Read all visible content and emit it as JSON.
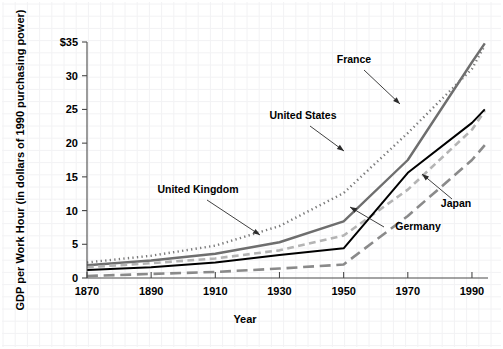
{
  "chart_data": {
    "type": "line",
    "title": "",
    "subtitle": "",
    "xlabel": "Year",
    "ylabel": "GDP per Work Hour (in dollars of 1990 purchasing power)",
    "xlim": [
      1870,
      1995
    ],
    "ylim": [
      0,
      35
    ],
    "grid": true,
    "grid_style": "faint graph-paper background grid",
    "legend": "inline labels with leader lines",
    "legend_position": "inline-annotations",
    "xticks": [
      1870,
      1890,
      1910,
      1930,
      1950,
      1970,
      1990
    ],
    "xtick_labels": [
      "1870",
      "1890",
      "1910",
      "1930",
      "1950",
      "1970",
      "1990"
    ],
    "yticks": [
      0,
      5,
      10,
      15,
      20,
      25,
      30,
      35
    ],
    "ytick_labels": [
      "0",
      "5",
      "10",
      "15",
      "20",
      "25",
      "30",
      "$35"
    ],
    "x": [
      1870,
      1890,
      1910,
      1930,
      1950,
      1970,
      1990,
      1994
    ],
    "series": [
      {
        "name": "France",
        "style": "solid",
        "color": "#6e6e6e",
        "width": 2.4,
        "values": [
          1.9,
          2.6,
          3.6,
          5.3,
          8.4,
          17.5,
          32.0,
          34.8
        ]
      },
      {
        "name": "United States",
        "style": "dotted",
        "color": "#7a7a7a",
        "width": 2.4,
        "values": [
          2.3,
          3.3,
          4.8,
          7.7,
          12.6,
          21.5,
          31.0,
          34.5
        ]
      },
      {
        "name": "United Kingdom",
        "style": "dashed",
        "color": "#b4b4b4",
        "width": 2.6,
        "values": [
          1.6,
          2.2,
          2.9,
          4.1,
          6.3,
          13.1,
          22.0,
          24.8
        ]
      },
      {
        "name": "Germany",
        "style": "solid",
        "color": "#000000",
        "width": 2.0,
        "values": [
          1.2,
          1.6,
          2.3,
          3.4,
          4.4,
          15.6,
          23.0,
          25.0
        ]
      },
      {
        "name": "Japan",
        "style": "long-dash",
        "color": "#8a8a8a",
        "width": 2.6,
        "values": [
          0.3,
          0.6,
          0.9,
          1.4,
          2.0,
          9.2,
          17.5,
          19.7
        ]
      }
    ],
    "annotations": [
      {
        "label": "France",
        "text_x": 354,
        "text_y": 63,
        "anchor": "middle",
        "leader_from_x": 364,
        "leader_from_y": 70,
        "leader_to_x": 400,
        "leader_to_y": 104
      },
      {
        "label": "United States",
        "text_x": 303,
        "text_y": 119,
        "anchor": "middle",
        "leader_from_x": 310,
        "leader_from_y": 126,
        "leader_to_x": 344,
        "leader_to_y": 151
      },
      {
        "label": "United Kingdom",
        "text_x": 198,
        "text_y": 193,
        "anchor": "middle",
        "leader_from_x": 207,
        "leader_from_y": 200,
        "leader_to_x": 260,
        "leader_to_y": 235
      },
      {
        "label": "Germany",
        "text_x": 418,
        "text_y": 230,
        "anchor": "middle",
        "leader_from_x": 384,
        "leader_from_y": 227,
        "leader_to_x": 350,
        "leader_to_y": 207
      },
      {
        "label": "Japan",
        "text_x": 456,
        "text_y": 207,
        "anchor": "middle",
        "leader_from_x": 452,
        "leader_from_y": 199,
        "leader_to_x": 422,
        "leader_to_y": 174
      }
    ]
  },
  "axes": {
    "ylabel": "GDP per Work Hour (in dollars of 1990 purchasing power)",
    "xlabel": "Year",
    "ytick_0": "0",
    "ytick_5": "5",
    "ytick_10": "10",
    "ytick_15": "15",
    "ytick_20": "20",
    "ytick_25": "25",
    "ytick_30": "30",
    "ytick_35": "$35",
    "xtick_1870": "1870",
    "xtick_1890": "1890",
    "xtick_1910": "1910",
    "xtick_1930": "1930",
    "xtick_1950": "1950",
    "xtick_1970": "1970",
    "xtick_1990": "1990"
  },
  "labels": {
    "france": "France",
    "united_states": "United States",
    "united_kingdom": "United Kingdom",
    "germany": "Germany",
    "japan": "Japan"
  }
}
